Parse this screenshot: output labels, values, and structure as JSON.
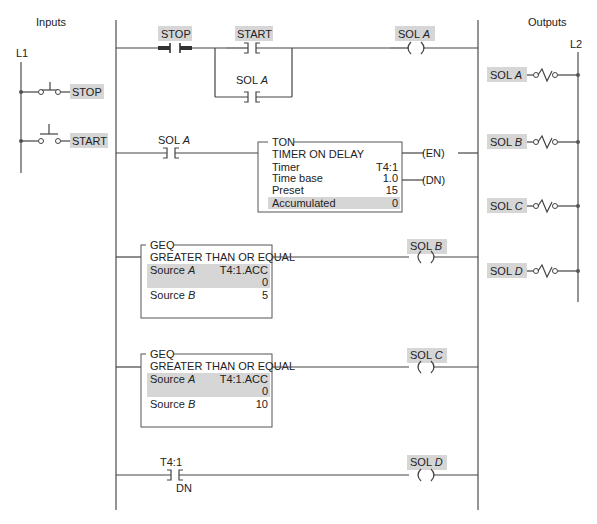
{
  "headers": {
    "inputs": "Inputs",
    "outputs": "Outputs"
  },
  "rails": {
    "left_input": "L1",
    "right_output": "L2"
  },
  "input_devices": [
    {
      "label": "STOP",
      "type": "normally-closed pushbutton"
    },
    {
      "label": "START",
      "type": "normally-open pushbutton"
    }
  ],
  "output_devices": [
    {
      "prefix": "SOL ",
      "letter": "A"
    },
    {
      "prefix": "SOL ",
      "letter": "B"
    },
    {
      "prefix": "SOL ",
      "letter": "C"
    },
    {
      "prefix": "SOL ",
      "letter": "D"
    }
  ],
  "rung1": {
    "stop_contact": "STOP",
    "start_contact": "START",
    "seal_prefix": "SOL ",
    "seal_letter": "A",
    "coil_prefix": "SOL ",
    "coil_letter": "A"
  },
  "rung2": {
    "contact_prefix": "SOL ",
    "contact_letter": "A",
    "ton": {
      "tag": "TON",
      "title": "TIMER ON DELAY",
      "rows": [
        {
          "label": "Timer",
          "value": "T4:1"
        },
        {
          "label": "Time base",
          "value": "1.0"
        },
        {
          "label": "Preset",
          "value": "15"
        },
        {
          "label": "Accumulated",
          "value": "0"
        }
      ],
      "outputs": [
        "(EN)",
        "(DN)"
      ]
    }
  },
  "rung3": {
    "geq": {
      "tag": "GEQ",
      "title": "GREATER THAN OR EQUAL",
      "source_a_label": "Source ",
      "source_a_letter": "A",
      "source_a_value": "T4:1.ACC",
      "source_a_current": "0",
      "source_b_label": "Source ",
      "source_b_letter": "B",
      "source_b_value": "5"
    },
    "coil_prefix": "SOL ",
    "coil_letter": "B"
  },
  "rung4": {
    "geq": {
      "tag": "GEQ",
      "title": "GREATER THAN OR EQUAL",
      "source_a_label": "Source ",
      "source_a_letter": "A",
      "source_a_value": "T4:1.ACC",
      "source_a_current": "0",
      "source_b_label": "Source ",
      "source_b_letter": "B",
      "source_b_value": "10"
    },
    "coil_prefix": "SOL ",
    "coil_letter": "C"
  },
  "rung5": {
    "contact_address": "T4:1",
    "contact_bit": "DN",
    "coil_prefix": "SOL ",
    "coil_letter": "D"
  }
}
